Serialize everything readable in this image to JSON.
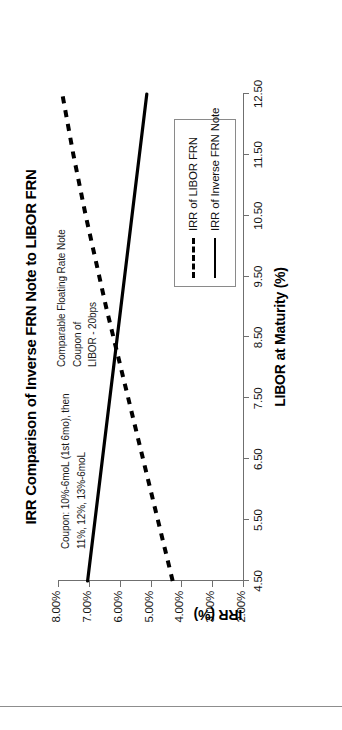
{
  "chart_data": {
    "type": "line",
    "title": "IRR Comparison of Inverse FRN Note to LIBOR FRN",
    "xlabel": "LIBOR at Maturity (%)",
    "ylabel": "IRR (%)",
    "xlim": [
      4.5,
      12.5
    ],
    "ylim": [
      2.0,
      8.0
    ],
    "xticks": [
      "4.50",
      "5.50",
      "6.50",
      "7.50",
      "8.50",
      "9.50",
      "10.50",
      "11.50",
      "12.50"
    ],
    "xtick_values": [
      4.5,
      5.5,
      6.5,
      7.5,
      8.5,
      9.5,
      10.5,
      11.5,
      12.5
    ],
    "yticks": [
      "2.00%",
      "3.00%",
      "4.00%",
      "5.00%",
      "6.00%",
      "7.00%",
      "8.00%"
    ],
    "ytick_values": [
      2.0,
      3.0,
      4.0,
      5.0,
      6.0,
      7.0,
      8.0
    ],
    "grid": false,
    "legend_position": "center-right",
    "x": [
      4.5,
      5.0,
      5.5,
      6.0,
      6.5,
      7.0,
      7.5,
      8.0,
      8.5,
      9.0,
      9.5,
      10.0,
      10.5,
      11.0,
      11.5,
      12.0,
      12.5
    ],
    "series": [
      {
        "name": "IRR of LIBOR FRN",
        "style": "dashed",
        "color": "#000000",
        "values": [
          4.28,
          4.52,
          4.76,
          5.0,
          5.24,
          5.48,
          5.72,
          5.96,
          6.2,
          6.44,
          6.66,
          6.88,
          7.1,
          7.3,
          7.5,
          7.68,
          7.86
        ]
      },
      {
        "name": "IRR of Inverse FRN Note",
        "style": "solid",
        "color": "#000000",
        "values": [
          7.04,
          6.92,
          6.8,
          6.68,
          6.56,
          6.44,
          6.32,
          6.2,
          6.08,
          5.96,
          5.84,
          5.72,
          5.6,
          5.48,
          5.36,
          5.24,
          5.12
        ]
      }
    ],
    "annotations": [
      {
        "id": "coupon-note",
        "text": "Coupon: 10%-6moL (1st 6mo), then\n11%, 12%, 13%-6moL"
      },
      {
        "id": "comparable-note",
        "text": "Comparable Floating Rate Note Coupon of\nLIBOR  -  20bps"
      }
    ]
  },
  "legend": {
    "entries": [
      {
        "label": "IRR of LIBOR FRN",
        "style": "dashed"
      },
      {
        "label": "IRR of Inverse FRN Note",
        "style": "solid"
      }
    ]
  }
}
